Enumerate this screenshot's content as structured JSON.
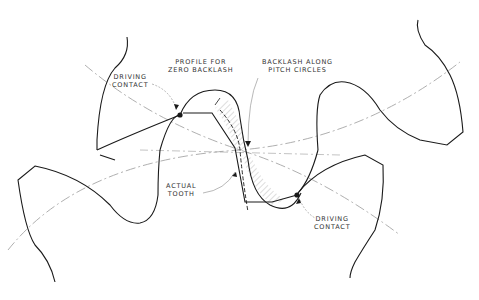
{
  "diagram": {
    "type": "gear-mesh-backlash",
    "colors": {
      "outline": "#1a1a1a",
      "pitch_circle": "#9a9a9a",
      "leader": "#888888",
      "hatch": "#bbbbbb",
      "background": "#ffffff"
    },
    "labels": {
      "driving_contact_top": "DRIVING\nCONTACT",
      "profile_zero_backlash": "PROFILE FOR\nZERO BACKLASH",
      "backlash_pitch_circles": "BACKLASH ALONG\nPITCH CIRCLES",
      "actual_tooth": "ACTUAL\nTOOTH",
      "driving_contact_bottom": "DRIVING\nCONTACT"
    }
  }
}
